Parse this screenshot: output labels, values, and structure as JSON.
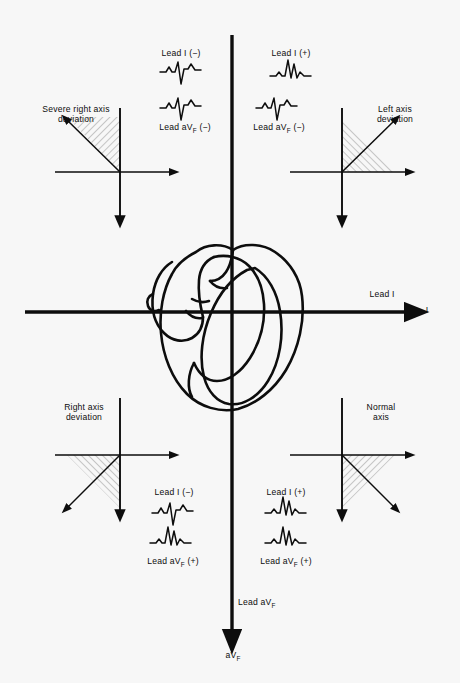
{
  "figure": {
    "background_color": "#f7f7f7",
    "ink_color": "#0d0d0d",
    "width": 460,
    "height": 683
  },
  "main_axes": {
    "horizontal": {
      "lead_label": "Lead I",
      "axis_tip_label": "I",
      "direction": "rightward"
    },
    "vertical": {
      "lead_label_pre": "Lead a",
      "lead_label_main": "V",
      "lead_label_sub": "F",
      "axis_tip_pre": "a",
      "axis_tip_main": "V",
      "axis_tip_sub": "F",
      "direction": "downward"
    }
  },
  "center_graphic": {
    "name": "heart-illustration",
    "description": "Line drawing of a four-chambered heart at the origin of the axes"
  },
  "quadrants": [
    {
      "id": "upper-left",
      "quadrant_label": "Severe right axis\ndeviation",
      "lead_i_label": "Lead I (−)",
      "lead_avf_label_pre": "Lead a",
      "lead_avf_label_main": "V",
      "lead_avf_label_sub": "F",
      "lead_avf_label_post": " (−)",
      "lead_i_polarity": "negative",
      "lead_avf_polarity": "negative",
      "vector_direction": "up-and-left",
      "shaded_sector": "upper-left",
      "ecg_top": "negative-qrs",
      "ecg_bottom": "negative-qrs"
    },
    {
      "id": "upper-right",
      "quadrant_label": "Left axis\ndeviation",
      "lead_i_label": "Lead I (+)",
      "lead_avf_label_pre": "Lead a",
      "lead_avf_label_main": "V",
      "lead_avf_label_sub": "F",
      "lead_avf_label_post": " (−)",
      "lead_i_polarity": "positive",
      "lead_avf_polarity": "negative",
      "vector_direction": "up-and-right",
      "shaded_sector": "upper-right",
      "ecg_top": "positive-qrs",
      "ecg_bottom": "negative-qrs"
    },
    {
      "id": "lower-left",
      "quadrant_label": "Right axis\ndeviation",
      "lead_i_label": "Lead I (−)",
      "lead_avf_label_pre": "Lead a",
      "lead_avf_label_main": "V",
      "lead_avf_label_sub": "F",
      "lead_avf_label_post": " (+)",
      "lead_i_polarity": "negative",
      "lead_avf_polarity": "positive",
      "vector_direction": "down-and-left",
      "shaded_sector": "lower-left",
      "ecg_top": "negative-qrs",
      "ecg_bottom": "positive-qrs"
    },
    {
      "id": "lower-right",
      "quadrant_label": "Normal\naxis",
      "lead_i_label": "Lead I (+)",
      "lead_avf_label_pre": "Lead a",
      "lead_avf_label_main": "V",
      "lead_avf_label_sub": "F",
      "lead_avf_label_post": " (+)",
      "lead_i_polarity": "positive",
      "lead_avf_polarity": "positive",
      "vector_direction": "down-and-right",
      "shaded_sector": "lower-right",
      "ecg_top": "positive-qrs",
      "ecg_bottom": "positive-qrs"
    }
  ]
}
